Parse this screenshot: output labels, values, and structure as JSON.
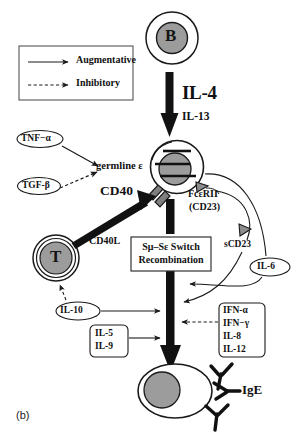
{
  "figure": {
    "panel_label": "(b)",
    "title_implicit": "IgE class switch regulation pathway"
  },
  "legend": {
    "items": [
      {
        "label": "Augmentative",
        "line_style": "solid",
        "name": "augmentative"
      },
      {
        "label": "Inhibitory",
        "line_style": "dashed",
        "name": "inhibitory"
      }
    ]
  },
  "cells": {
    "b_cell_top": {
      "letter": "B",
      "name": "b-cell"
    },
    "b_cell_mid": {
      "letter": "",
      "name": "activated-b-cell"
    },
    "t_cell": {
      "letter": "T",
      "name": "t-cell"
    },
    "plasma_cell": {
      "letter": "",
      "name": "plasma-cell"
    }
  },
  "signals": {
    "il4": "IL-4",
    "il13": "IL-13",
    "germline": "germline ε",
    "cd40": "CD40",
    "cd40l": "CD40L",
    "switch_line1": "Sμ–Sε Switch",
    "switch_line2": "Recombination",
    "fcer_line1": "FcεRII",
    "fcer_line2": "(CD23)",
    "scd23": "sCD23",
    "ige": "IgE"
  },
  "cytokines": {
    "tnf_alpha": "TNF−α",
    "tgf_beta": "TGF-β",
    "il6": "IL-6",
    "il10": "IL-10",
    "il5": "IL-5",
    "il9": "IL-9",
    "inhibitory_group": [
      "IFN-α",
      "IFN−γ",
      "IL-8",
      "IL-12"
    ]
  },
  "colors": {
    "stroke": "#1a1a1a",
    "nucleus_fill": "#9c9c9c",
    "cytoplasm_fill": "#ffffff",
    "background": "#ffffff",
    "receptor_fill": "#8d8d8d"
  }
}
